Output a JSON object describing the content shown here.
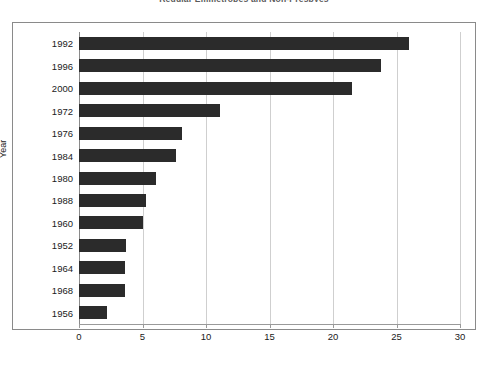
{
  "chart_data": {
    "type": "bar",
    "orientation": "horizontal",
    "title": "Regular Emmetropes and Non-Presbyes",
    "xlabel": "",
    "ylabel": "Year",
    "categories": [
      "1992",
      "1996",
      "2000",
      "1972",
      "1976",
      "1984",
      "1980",
      "1988",
      "1960",
      "1952",
      "1964",
      "1968",
      "1956"
    ],
    "values": [
      26.0,
      23.8,
      21.5,
      11.1,
      8.1,
      7.6,
      6.1,
      5.3,
      5.0,
      3.7,
      3.6,
      3.6,
      2.2
    ],
    "xlim": [
      0,
      30
    ],
    "xticks": [
      0,
      5,
      10,
      15,
      20,
      25,
      30
    ],
    "xtick_labels": [
      "0",
      "5",
      "10",
      "15",
      "20",
      "25",
      "30"
    ],
    "grid": true,
    "grid_axis": "x",
    "legend": null,
    "bar_color": "#2b2b2b",
    "background_color": "#ffffff",
    "frame_color": "#8a8a8a",
    "gridline_color": "#cfcfcf"
  }
}
